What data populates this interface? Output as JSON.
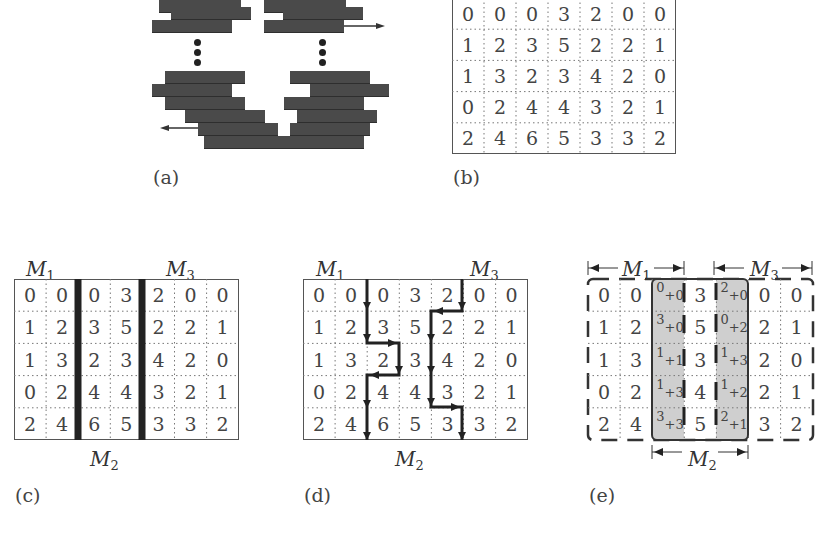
{
  "panels": {
    "a": {
      "caption": "(a)"
    },
    "b": {
      "caption": "(b)",
      "matrix": [
        [
          0,
          0,
          0,
          3,
          2,
          0,
          0
        ],
        [
          1,
          2,
          3,
          5,
          2,
          2,
          1
        ],
        [
          1,
          3,
          2,
          3,
          4,
          2,
          0
        ],
        [
          0,
          2,
          4,
          4,
          3,
          2,
          1
        ],
        [
          2,
          4,
          6,
          5,
          3,
          3,
          2
        ]
      ]
    },
    "c": {
      "caption": "(c)",
      "labels": {
        "m1": "M",
        "m1_sub": "1",
        "m2": "M",
        "m2_sub": "2",
        "m3": "M",
        "m3_sub": "3"
      },
      "matrix": [
        [
          0,
          0,
          0,
          3,
          2,
          0,
          0
        ],
        [
          1,
          2,
          3,
          5,
          2,
          2,
          1
        ],
        [
          1,
          3,
          2,
          3,
          4,
          2,
          0
        ],
        [
          0,
          2,
          4,
          4,
          3,
          2,
          1
        ],
        [
          2,
          4,
          6,
          5,
          3,
          3,
          2
        ]
      ]
    },
    "d": {
      "caption": "(d)",
      "labels": {
        "m1": "M",
        "m1_sub": "1",
        "m2": "M",
        "m2_sub": "2",
        "m3": "M",
        "m3_sub": "3"
      },
      "matrix": [
        [
          0,
          0,
          0,
          3,
          2,
          0,
          0
        ],
        [
          1,
          2,
          3,
          5,
          2,
          2,
          1
        ],
        [
          1,
          3,
          2,
          3,
          4,
          2,
          0
        ],
        [
          0,
          2,
          4,
          4,
          3,
          2,
          1
        ],
        [
          2,
          4,
          6,
          5,
          3,
          3,
          2
        ]
      ]
    },
    "e": {
      "caption": "(e)",
      "labels": {
        "m1": "M",
        "m1_sub": "1",
        "m2": "M",
        "m2_sub": "2",
        "m3": "M",
        "m3_sub": "3"
      },
      "matrix": [
        [
          "0",
          "0",
          "0+0",
          "3",
          "2+0",
          "0",
          "0"
        ],
        [
          "1",
          "2",
          "3+0",
          "5",
          "0+2",
          "2",
          "1"
        ],
        [
          "1",
          "3",
          "1+1",
          "3",
          "1+3",
          "2",
          "0"
        ],
        [
          "0",
          "2",
          "1+3",
          "4",
          "1+2",
          "2",
          "1"
        ],
        [
          "2",
          "4",
          "3+3",
          "5",
          "2+1",
          "3",
          "2"
        ]
      ]
    }
  }
}
